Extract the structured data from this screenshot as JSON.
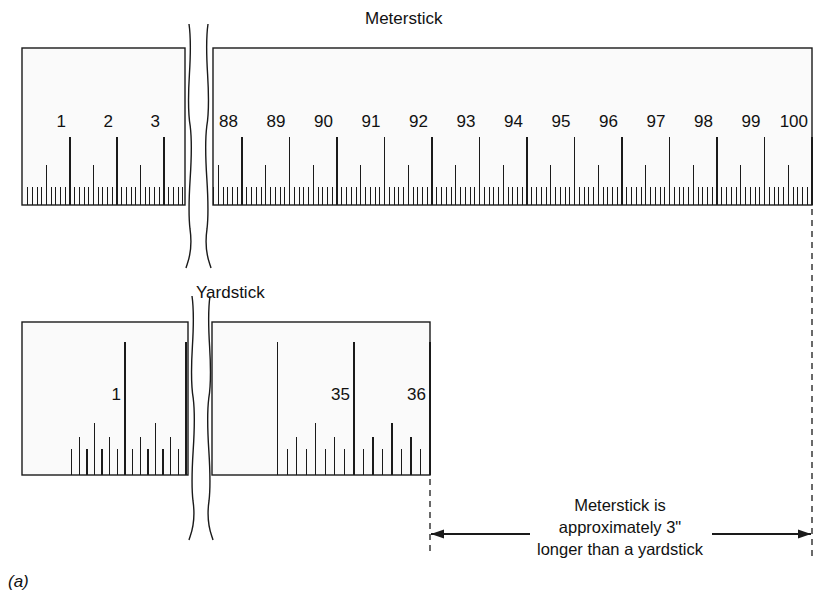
{
  "figure": {
    "label": "(a)",
    "meterstick_title": "Meterstick",
    "yardstick_title": "Yardstick",
    "caption_line1": "Meterstick is",
    "caption_line2": "approximately 3\"",
    "caption_line3": "longer than a yardstick",
    "ink_color": "#1a1a1a",
    "stick_fill": "#fafafa"
  },
  "meterstick": {
    "unit": "cm",
    "left_segment_labels": [
      "1",
      "2",
      "3"
    ],
    "right_segment_labels": [
      "88",
      "89",
      "90",
      "91",
      "92",
      "93",
      "94",
      "95",
      "96",
      "97",
      "98",
      "99",
      "100"
    ],
    "total_length_cm": 100,
    "minor_divisions_per_cm": 10,
    "half_mark_every_mm": 5
  },
  "yardstick": {
    "unit": "in",
    "left_segment_labels": [
      "1"
    ],
    "right_segment_labels": [
      "35",
      "36"
    ],
    "total_length_in": 36,
    "minor_divisions_per_inch": 8
  },
  "chart_data": {
    "type": "diagram",
    "annotation": "Meterstick is approximately 3\" longer than a yardstick",
    "items": [
      {
        "name": "Meterstick",
        "length": 100,
        "unit": "cm",
        "equivalent_in": 39.37
      },
      {
        "name": "Yardstick",
        "length": 36,
        "unit": "in",
        "equivalent_cm": 91.44
      }
    ],
    "difference_in": 3
  }
}
